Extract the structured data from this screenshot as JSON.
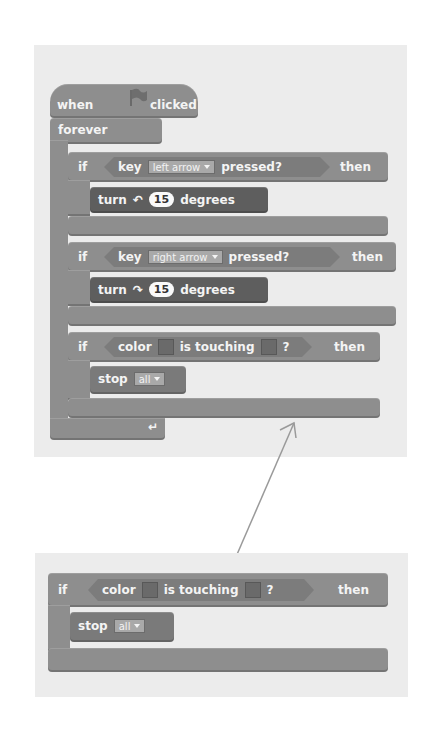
{
  "top_script": {
    "hat": {
      "when": "when",
      "flag_icon": "green-flag",
      "clicked": "clicked"
    },
    "forever": "forever",
    "if_blocks": [
      {
        "if": "if",
        "condition": {
          "key": "key",
          "dropdown": "left arrow",
          "pressed": "pressed?"
        },
        "then": "then",
        "body": {
          "turn": "turn",
          "icon": "turn-left-arrow",
          "icon_glyph": "↶",
          "value": "15",
          "degrees": "degrees"
        }
      },
      {
        "if": "if",
        "condition": {
          "key": "key",
          "dropdown": "right arrow",
          "pressed": "pressed?"
        },
        "then": "then",
        "body": {
          "turn": "turn",
          "icon": "turn-right-arrow",
          "icon_glyph": "↷",
          "value": "15",
          "degrees": "degrees"
        }
      },
      {
        "if": "if",
        "condition": {
          "color": "color",
          "is_touching": "is touching",
          "q": "?"
        },
        "then": "then",
        "body": {
          "stop": "stop",
          "dropdown": "all"
        }
      }
    ],
    "loop_arrow_glyph": "↵"
  },
  "bottom_script": {
    "if": "if",
    "condition": {
      "color": "color",
      "is_touching": "is touching",
      "q": "?"
    },
    "then": "then",
    "body": {
      "stop": "stop",
      "dropdown": "all"
    }
  },
  "colors": {
    "block": "#8e8e8e",
    "motion_block": "#5e5e5e",
    "panel": "#ececec",
    "arrow": "#999999"
  }
}
